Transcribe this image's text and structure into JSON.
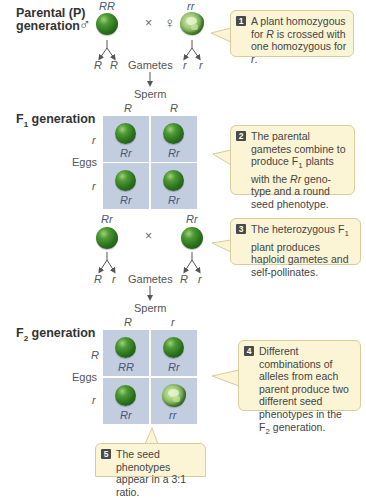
{
  "parental": {
    "label_line1": "Parental (P)",
    "label_line2": "generation",
    "male_symbol": "♂",
    "female_symbol": "♀",
    "cross_symbol": "×",
    "male_genotype": "RR",
    "female_genotype": "rr",
    "male_gametes": [
      "R",
      "R"
    ],
    "female_gametes": [
      "r",
      "r"
    ],
    "gametes_label": "Gametes",
    "sperm_label": "Sperm"
  },
  "f1": {
    "label": "F",
    "label_sub": "1",
    "label_rest": " generation",
    "sperm_alleles": [
      "R",
      "R"
    ],
    "egg_alleles": [
      "r",
      "r"
    ],
    "eggs_label": "Eggs",
    "cells": [
      {
        "genotype": "Rr",
        "phenotype": "round"
      },
      {
        "genotype": "Rr",
        "phenotype": "round"
      },
      {
        "genotype": "Rr",
        "phenotype": "round"
      },
      {
        "genotype": "Rr",
        "phenotype": "round"
      }
    ]
  },
  "f1_cross": {
    "left_genotype": "Rr",
    "right_genotype": "Rr",
    "cross_symbol": "×",
    "left_gametes": [
      "R",
      "r"
    ],
    "right_gametes": [
      "R",
      "r"
    ],
    "gametes_label": "Gametes",
    "sperm_label": "Sperm"
  },
  "f2": {
    "label": "F",
    "label_sub": "2",
    "label_rest": " generation",
    "sperm_alleles": [
      "R",
      "r"
    ],
    "egg_alleles": [
      "R",
      "r"
    ],
    "eggs_label": "Eggs",
    "cells": [
      {
        "genotype": "RR",
        "phenotype": "round"
      },
      {
        "genotype": "Rr",
        "phenotype": "round"
      },
      {
        "genotype": "Rr",
        "phenotype": "round"
      },
      {
        "genotype": "rr",
        "phenotype": "wrinkled"
      }
    ]
  },
  "callouts": [
    {
      "number": "1",
      "text_a": "A plant homozygous for ",
      "italic_a": "R",
      "text_b": " is crossed with one homozygous for ",
      "italic_b": "r",
      "text_c": "."
    },
    {
      "number": "2",
      "text_a": "The parental gametes combine to produce F",
      "sub": "1",
      "text_b": " plants with the ",
      "italic": "Rr",
      "text_c": " geno-type and a round seed phenotype."
    },
    {
      "number": "3",
      "text_a": "The heterozygous F",
      "sub": "1",
      "text_b": " plant produces haploid gametes and self-pollinates."
    },
    {
      "number": "4",
      "text_a": "Different combinations of alleles from each parent produce two different seed phenotypes in the F",
      "sub": "2",
      "text_b": " generation."
    },
    {
      "number": "5",
      "text_a": "The seed phenotypes appear in a 3:1 ratio."
    }
  ],
  "colors": {
    "punnett_cell": "#c3cde0",
    "callout_bg": "#fbf5d6",
    "seed_green": "#2a6f1d"
  }
}
